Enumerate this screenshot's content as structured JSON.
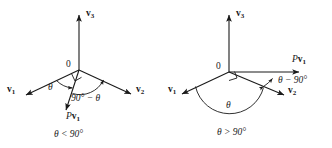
{
  "figure": {
    "type": "vector-projection-diagram-pair",
    "stroke_color": "#1a1a1a",
    "background_color": "#ffffff",
    "text_color": "#1a1a1a"
  },
  "panels": [
    {
      "id": "left",
      "caption": "θ < 90°",
      "origin_label": "0",
      "axis_up_label": {
        "name": "v",
        "subscript": "3"
      },
      "axis_left_label": {
        "name": "v",
        "subscript": "1"
      },
      "axis_right_label": {
        "name": "v",
        "subscript": "2"
      },
      "projection_label": {
        "prefix": "P",
        "name": "v",
        "subscript": "1"
      },
      "angle_theta_label": "θ",
      "angle_complement_label": "90° − θ",
      "right_angle_marker": "present"
    },
    {
      "id": "right",
      "caption": "θ > 90°",
      "origin_label": "0",
      "axis_up_label": {
        "name": "v",
        "subscript": "3"
      },
      "axis_left_label": {
        "name": "v",
        "subscript": "1"
      },
      "axis_right_label": {
        "name": "v",
        "subscript": "2"
      },
      "projection_label": {
        "prefix": "P",
        "name": "v",
        "subscript": "1"
      },
      "angle_theta_label": "θ",
      "angle_excess_label": "θ − 90°",
      "right_angle_marker": "present"
    }
  ]
}
